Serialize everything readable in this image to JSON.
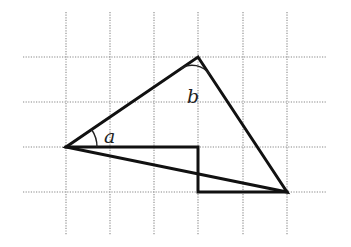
{
  "diagram": {
    "type": "geometry-grid",
    "grid": {
      "vertical_x": [
        66,
        110,
        154,
        198,
        243,
        287
      ],
      "horizontal_y": [
        57,
        102,
        147,
        192
      ],
      "v_extent": [
        12,
        235
      ],
      "h_extent": [
        23,
        326
      ],
      "color": "#888888"
    },
    "triangle": {
      "points": [
        [
          66,
          147
        ],
        [
          198,
          57
        ],
        [
          287,
          192
        ]
      ]
    },
    "step_outline": {
      "points": [
        [
          66,
          147
        ],
        [
          198,
          147
        ],
        [
          198,
          192
        ],
        [
          287,
          192
        ]
      ]
    },
    "angles": [
      {
        "label": "a",
        "vertex": [
          66,
          147
        ],
        "radius": 31,
        "text_pos": [
          104,
          143
        ]
      },
      {
        "label": "b",
        "vertex": [
          198,
          57
        ],
        "radius": 21,
        "text_pos": [
          187,
          103
        ]
      }
    ],
    "stroke_color": "#111111"
  }
}
